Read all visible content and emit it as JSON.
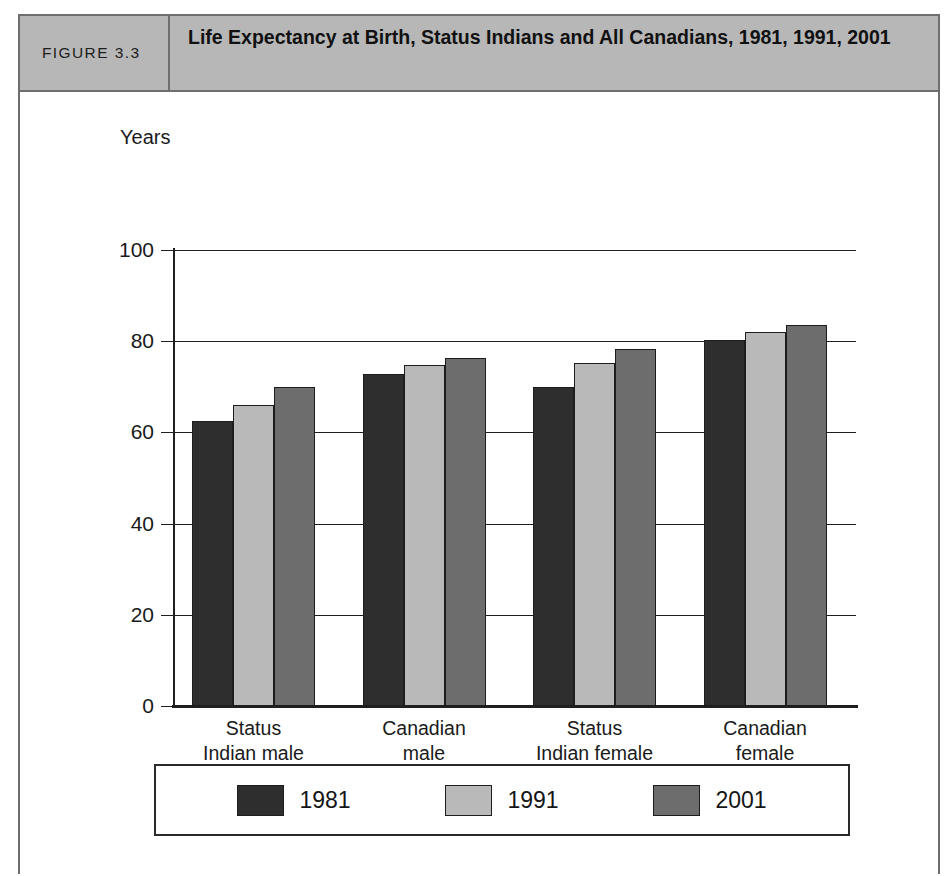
{
  "figure": {
    "number_label": "FIGURE 3.3",
    "title": "Life Expectancy at Birth, Status Indians and All Canadians, 1981, 1991, 2001"
  },
  "chart_data": {
    "type": "bar",
    "title": "Life Expectancy at Birth, Status Indians and All Canadians, 1981, 1991, 2001",
    "xlabel": "Group",
    "ylabel": "Years",
    "ylim": [
      0,
      100
    ],
    "ytick_labels": [
      "0",
      "20",
      "40",
      "60",
      "80",
      "100"
    ],
    "ytick_values": [
      0,
      20,
      40,
      60,
      80,
      100
    ],
    "grid": true,
    "legend_position": "bottom",
    "categories": [
      "Status\nIndian male",
      "Canadian\nmale",
      "Status\nIndian female",
      "Canadian\nfemale"
    ],
    "category_lines": [
      [
        "Status",
        "Indian male"
      ],
      [
        "Canadian",
        "male"
      ],
      [
        "Status",
        "Indian female"
      ],
      [
        "Canadian",
        "female"
      ]
    ],
    "series": [
      {
        "name": "1981",
        "color": "#2e2e2e",
        "values": [
          62.5,
          72.8,
          70.0,
          80.2
        ]
      },
      {
        "name": "1991",
        "color": "#b9b9b9",
        "values": [
          66.0,
          74.8,
          75.3,
          82.0
        ]
      },
      {
        "name": "2001",
        "color": "#6d6d6d",
        "values": [
          70.0,
          76.3,
          78.2,
          83.6
        ]
      }
    ]
  },
  "legend": {
    "items": [
      {
        "label": "1981",
        "swatch_class": "y1981"
      },
      {
        "label": "1991",
        "swatch_class": "y1991"
      },
      {
        "label": "2001",
        "swatch_class": "y2001"
      }
    ]
  },
  "colors": {
    "header_band": "#b7b7b7",
    "frame_border": "#6e6e6e",
    "axis": "#1f1f1f",
    "series_1981": "#2e2e2e",
    "series_1991": "#b9b9b9",
    "series_2001": "#6d6d6d"
  }
}
